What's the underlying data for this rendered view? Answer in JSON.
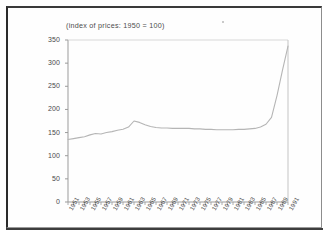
{
  "chart_data": {
    "type": "line",
    "title": "(index of prices: 1950 = 100)",
    "xlabel": "",
    "ylabel": "",
    "ylim": [
      0,
      350
    ],
    "xlim": [
      1951,
      1991
    ],
    "grid": false,
    "legend": null,
    "y_ticks": [
      0,
      50,
      100,
      150,
      200,
      250,
      300,
      350
    ],
    "x_ticks": [
      1951,
      1953,
      1955,
      1957,
      1959,
      1961,
      1963,
      1965,
      1967,
      1969,
      1971,
      1973,
      1975,
      1977,
      1979,
      1981,
      1983,
      1985,
      1987,
      1989,
      1991
    ],
    "x_tick_labels": [
      "1951",
      "1953",
      "1955",
      "1957",
      "1959",
      "1961",
      "1963",
      "1965",
      "1967",
      "1969",
      "1971",
      "1973",
      "1975",
      "1977",
      "1979",
      "1981",
      "1983",
      "1985",
      "1987",
      "1989",
      "1991"
    ],
    "series": [
      {
        "name": "index of prices",
        "x": [
          1951,
          1952,
          1953,
          1954,
          1955,
          1956,
          1957,
          1958,
          1959,
          1960,
          1961,
          1962,
          1963,
          1964,
          1965,
          1966,
          1967,
          1968,
          1969,
          1970,
          1971,
          1972,
          1973,
          1974,
          1975,
          1976,
          1977,
          1978,
          1979,
          1980,
          1981,
          1982,
          1983,
          1984,
          1985,
          1986,
          1987,
          1988,
          1989,
          1990,
          1991
        ],
        "values": [
          135,
          137,
          139,
          141,
          145,
          148,
          147,
          150,
          152,
          155,
          157,
          162,
          175,
          172,
          167,
          163,
          161,
          160,
          160,
          159,
          159,
          159,
          159,
          158,
          158,
          157,
          157,
          156,
          156,
          156,
          156,
          157,
          157,
          158,
          159,
          162,
          168,
          183,
          230,
          285,
          337
        ]
      }
    ],
    "line_color": "#b5b5b5",
    "axis_color": "#9b9b9b",
    "text_color": "#4a4a4a"
  },
  "page": {
    "background": "#ffffff",
    "frame_color": "#2b2b2b"
  }
}
